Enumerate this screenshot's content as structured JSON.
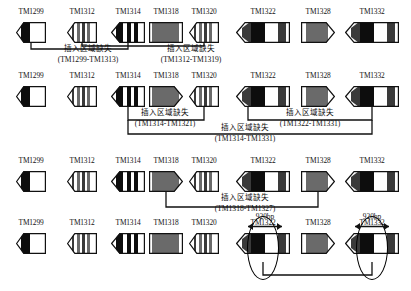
{
  "figure": {
    "rows": [
      {
        "id": "row-1",
        "genes": [
          {
            "label": "TM1299",
            "shape": "point-left",
            "pattern": "black-bar"
          },
          {
            "label": "TM1312",
            "shape": "point-left",
            "pattern": "fine-stripes"
          },
          {
            "label": "TM1314",
            "shape": "point-left",
            "pattern": "bold-stripes"
          },
          {
            "label": "TM1318",
            "shape": "rect",
            "pattern": "gray"
          },
          {
            "label": "TM1320",
            "shape": "point-left",
            "pattern": "fine-stripes"
          },
          {
            "label": "TM1322",
            "shape": "point-left",
            "pattern": "dark-white-dark"
          },
          {
            "label": "TM1328",
            "shape": "point-right",
            "pattern": "white-gray"
          },
          {
            "label": "TM1332",
            "shape": "point-left",
            "pattern": "dark-white-dark"
          }
        ],
        "deletions": [
          {
            "cn": "插入区域缺失",
            "range": "(TM1299-TM1313)"
          },
          {
            "cn": "插入区域缺失",
            "range": "(TM1312-TM1319)"
          }
        ]
      },
      {
        "id": "row-2",
        "genes": [
          {
            "label": "TM1299",
            "shape": "point-left",
            "pattern": "black-bar"
          },
          {
            "label": "TM1312",
            "shape": "point-left",
            "pattern": "fine-stripes"
          },
          {
            "label": "TM1314",
            "shape": "point-left",
            "pattern": "bold-stripes"
          },
          {
            "label": "TM1318",
            "shape": "point-right",
            "pattern": "gray"
          },
          {
            "label": "TM1320",
            "shape": "point-left",
            "pattern": "fine-stripes"
          },
          {
            "label": "TM1322",
            "shape": "point-left",
            "pattern": "dark-white-dark"
          },
          {
            "label": "TM1328",
            "shape": "point-right",
            "pattern": "white-gray"
          },
          {
            "label": "TM1332",
            "shape": "point-left",
            "pattern": "dark-white-dark"
          }
        ],
        "deletions": [
          {
            "cn": "插入区域缺失",
            "range": "(TM1314-TM1321)"
          },
          {
            "cn": "插入区域缺失",
            "range": "(TM1322-TM1331)"
          },
          {
            "cn": "插入区域缺失",
            "range": "(TM1314-TM1331)"
          }
        ]
      },
      {
        "id": "row-3",
        "genes": [
          {
            "label": "TM1299",
            "shape": "point-left",
            "pattern": "black-bar"
          },
          {
            "label": "TM1312",
            "shape": "point-left",
            "pattern": "fine-stripes"
          },
          {
            "label": "TM1314",
            "shape": "point-left",
            "pattern": "bold-stripes"
          },
          {
            "label": "TM1318",
            "shape": "point-right",
            "pattern": "gray"
          },
          {
            "label": "TM1320",
            "shape": "point-left",
            "pattern": "fine-stripes"
          },
          {
            "label": "TM1322",
            "shape": "point-left",
            "pattern": "dark-white-dark"
          },
          {
            "label": "TM1328",
            "shape": "point-right",
            "pattern": "white-gray"
          },
          {
            "label": "TM1332",
            "shape": "point-left",
            "pattern": "dark-white-dark"
          }
        ],
        "deletions": [
          {
            "cn": "插入区域缺失",
            "range": "(TM1318-TM1327)"
          }
        ]
      },
      {
        "id": "row-4",
        "genes": [
          {
            "label": "TM1299",
            "shape": "point-left",
            "pattern": "black-bar"
          },
          {
            "label": "TM1312",
            "shape": "point-left",
            "pattern": "fine-stripes"
          },
          {
            "label": "TM1314",
            "shape": "point-left",
            "pattern": "bold-stripes"
          },
          {
            "label": "TM1318",
            "shape": "rect",
            "pattern": "gray"
          },
          {
            "label": "TM1320",
            "shape": "point-left",
            "pattern": "fine-stripes"
          },
          {
            "label": "TM1322",
            "shape": "point-left",
            "pattern": "dark-white-dark"
          },
          {
            "label": "TM1328",
            "shape": "point-right",
            "pattern": "white-gray"
          },
          {
            "label": "TM1332",
            "shape": "point-left",
            "pattern": "dark-white-dark"
          }
        ],
        "measures": [
          {
            "label": "920bp"
          },
          {
            "label": "920bp"
          }
        ]
      }
    ]
  },
  "colors": {
    "stroke": "#111111",
    "black": "#0d0d0d",
    "dark_gray": "#3a3a3a",
    "mid_gray": "#6a6a6a",
    "light_gray": "#9a9a9a",
    "white": "#ffffff"
  }
}
